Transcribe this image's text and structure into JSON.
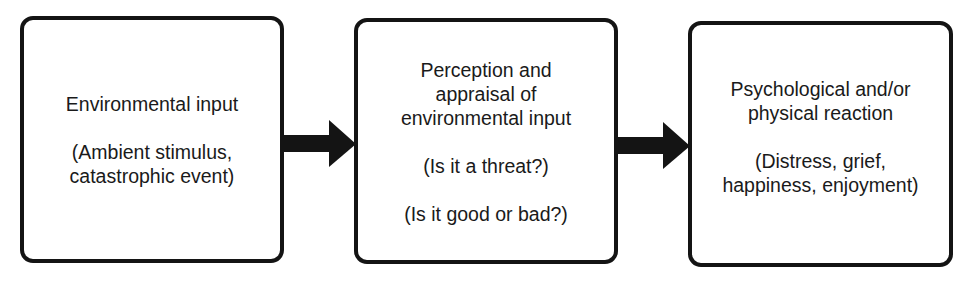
{
  "diagram": {
    "type": "flowchart",
    "direction": "left-to-right",
    "colors": {
      "stroke": "#141414",
      "fill": "#ffffff",
      "text": "#1a1a1a"
    },
    "nodes": [
      {
        "id": "environmental-input",
        "title_lines": [
          "Environmental input"
        ],
        "paragraphs": [
          [
            "(Ambient stimulus,",
            "catastrophic event)"
          ]
        ]
      },
      {
        "id": "perception-appraisal",
        "title_lines": [
          "Perception and",
          "appraisal of",
          "environmental input"
        ],
        "paragraphs": [
          [
            "(Is it a threat?)"
          ],
          [
            "(Is it good or bad?)"
          ]
        ]
      },
      {
        "id": "reaction",
        "title_lines": [
          "Psychological and/or",
          "physical reaction"
        ],
        "paragraphs": [
          [
            "(Distress, grief,",
            "happiness, enjoyment)"
          ]
        ]
      }
    ],
    "edges": [
      {
        "from": "environmental-input",
        "to": "perception-appraisal",
        "style": "thick-arrow"
      },
      {
        "from": "perception-appraisal",
        "to": "reaction",
        "style": "thick-arrow"
      }
    ]
  }
}
